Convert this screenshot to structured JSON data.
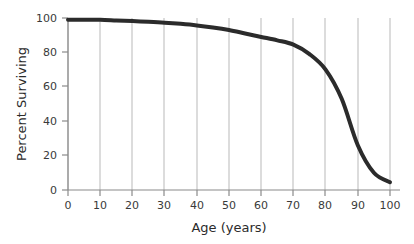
{
  "chart_data": {
    "type": "line",
    "title": "",
    "subtitle": "",
    "xlabel": "Age (years)",
    "ylabel": "Percent Surviving",
    "xlim": [
      0,
      100
    ],
    "ylim": [
      0,
      100
    ],
    "xticks": [
      0,
      10,
      20,
      30,
      40,
      50,
      60,
      70,
      80,
      90,
      100
    ],
    "xticklabels": [
      "0",
      "10",
      "20",
      "30",
      "40",
      "50",
      "60",
      "70",
      "80",
      "90",
      "100"
    ],
    "yticks": [
      0,
      20,
      40,
      60,
      80,
      100
    ],
    "yticklabels": [
      "0",
      "20",
      "40",
      "60",
      "80",
      "100"
    ],
    "grid": "vertical-only",
    "legend": "none",
    "series": [
      {
        "name": "Percent surviving",
        "color": "#2b2b2b",
        "linewidth": 4,
        "x": [
          0,
          5,
          10,
          15,
          20,
          25,
          30,
          35,
          40,
          45,
          50,
          55,
          60,
          65,
          70,
          75,
          80,
          85,
          90,
          95,
          100
        ],
        "values": [
          99,
          99,
          99,
          98.6,
          98.2,
          97.8,
          97.3,
          96.6,
          95.7,
          94.5,
          93,
          91,
          89,
          87,
          84.5,
          79,
          70,
          53,
          26,
          10,
          4.5
        ]
      }
    ],
    "annotations": []
  },
  "axes": {
    "x_tick_labels": [
      "0",
      "10",
      "20",
      "30",
      "40",
      "50",
      "60",
      "70",
      "80",
      "90",
      "100"
    ],
    "y_tick_labels": [
      "0",
      "20",
      "40",
      "60",
      "80",
      "100"
    ],
    "x_title": "Age (years)",
    "y_title": "Percent Surviving"
  },
  "colors": {
    "curve": "#2b2b2b",
    "gridline": "#b9b9b9",
    "axis": "#8a8a8a",
    "tick_text": "#3a3a3a",
    "title_text": "#2b2b2b",
    "background": "#ffffff"
  }
}
